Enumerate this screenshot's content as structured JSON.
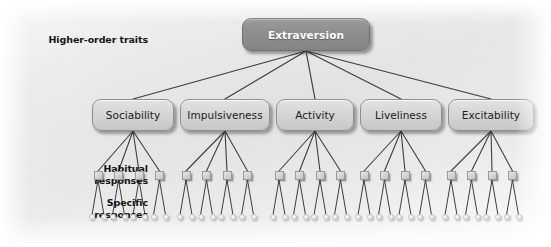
{
  "figure": {
    "background_color": "#f0f0f0"
  },
  "row_labels": [
    {
      "id": "higher-order-traits",
      "text": "Higher-order traits",
      "x": 28,
      "y": 34
    },
    {
      "id": "traits",
      "text": "Traits",
      "x": 28,
      "y": 111
    },
    {
      "id": "habitual-responses",
      "text": "Habitual\nresponses",
      "x": 28,
      "y": 166
    },
    {
      "id": "specific-responses",
      "text": "Specific\nresponses",
      "x": 28,
      "y": 200
    }
  ],
  "higher_order": {
    "label": "Extraversion",
    "box_color": "#8f8f8f",
    "text_color": "#ffffff",
    "x": 242,
    "y": 18,
    "w": 128,
    "h": 33
  },
  "traits": [
    {
      "label": "Sociability",
      "x": 92,
      "y": 99,
      "w": 82,
      "h": 32
    },
    {
      "label": "Impulsiveness",
      "x": 180,
      "y": 99,
      "w": 90,
      "h": 32
    },
    {
      "label": "Activity",
      "x": 276,
      "y": 99,
      "w": 78,
      "h": 32
    },
    {
      "label": "Liveliness",
      "x": 360,
      "y": 99,
      "w": 82,
      "h": 32
    },
    {
      "label": "Excitability",
      "x": 448,
      "y": 99,
      "w": 86,
      "h": 32
    }
  ],
  "levels": {
    "habitual_per_trait": 4,
    "habitual_total": 20,
    "specific_per_habitual": 2,
    "specific_total": 40,
    "habitual_y": 171,
    "specific_y": 214,
    "habitual_box_color": "#d3d3d3",
    "specific_dot_color": "#efefef",
    "group_first_x": [
      98,
      186,
      279,
      364,
      451
    ],
    "habitual_spacing": 20.5,
    "specific_offsets": [
      -6,
      6
    ]
  },
  "connector": {
    "color": "#3d3d3d",
    "width": 1.1
  }
}
